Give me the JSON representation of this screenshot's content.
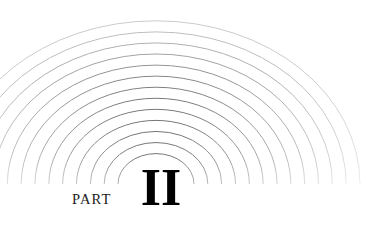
{
  "page": {
    "title": "PART II",
    "background_color": "#ffffff",
    "width": 376,
    "height": 228
  },
  "label": {
    "part_word": "PART",
    "part_numeral": "II",
    "text_color": "#1a1a1a",
    "numeral_color": "#000000"
  },
  "artwork": {
    "name": "concentric-arc-rainbow",
    "description": "Concentric semi-elliptical arcs radiating from a point near the bottom center, darkest at the innermost ring and fading to near-white at the outermost ring and toward the baseline.",
    "center_x": 156,
    "baseline_y": 184,
    "arc_count": 13,
    "innermost_radius_x": 38,
    "outermost_radius_x": 204,
    "radius_ratio_y": 0.8,
    "stroke_color_inner": "#111111",
    "stroke_color_outer": "#c9cbcf",
    "stroke_width": 1
  }
}
